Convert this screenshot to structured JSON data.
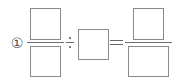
{
  "problem": {
    "number_label": "①",
    "operator_divide": "÷",
    "operator_equals": "=",
    "left_fraction": {
      "numerator": "",
      "denominator": ""
    },
    "divisor": "",
    "result_fraction": {
      "numerator": "",
      "denominator": ""
    }
  },
  "colors": {
    "border": "#8a8a8a",
    "text": "#555555",
    "background": "#ffffff"
  }
}
